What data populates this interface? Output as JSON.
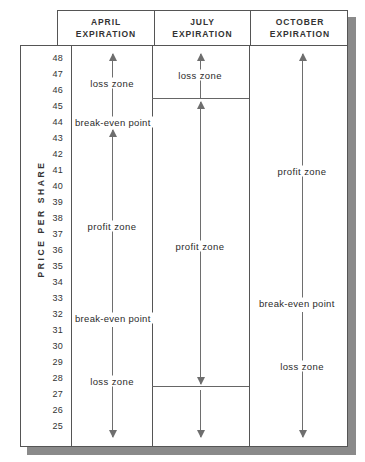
{
  "figure": {
    "kind": "option-expiration-profit-loss-diagram",
    "axis_title": "PRICE PER SHARE"
  },
  "chart_data": {
    "type": "table",
    "title": "",
    "xlabel": "",
    "ylabel": "PRICE PER SHARE",
    "ylim": [
      25,
      48
    ],
    "grid": false,
    "legend": "none",
    "categories": [
      "APRIL EXPIRATION",
      "JULY EXPIRATION",
      "OCTOBER EXPIRATION"
    ],
    "y_ticks": [
      48,
      47,
      46,
      45,
      44,
      43,
      42,
      41,
      40,
      39,
      38,
      37,
      36,
      35,
      34,
      33,
      32,
      31,
      30,
      29,
      28,
      27,
      26,
      25
    ],
    "series": [
      {
        "name": "APRIL EXPIRATION",
        "break_even_points": [
          44,
          32
        ],
        "zones": [
          {
            "label": "loss zone",
            "from": 44,
            "to": 48,
            "direction": "up"
          },
          {
            "label": "profit zone",
            "from": 44,
            "to": 32,
            "direction": "down"
          },
          {
            "label": "loss zone",
            "from": 32,
            "to": 25,
            "direction": "down"
          }
        ]
      },
      {
        "name": "JULY EXPIRATION",
        "break_even_points": [
          45.7,
          27.8
        ],
        "zones": [
          {
            "label": "loss zone",
            "from": 45.7,
            "to": 48,
            "direction": "up"
          },
          {
            "label": "profit zone",
            "from": 45.7,
            "to": 27.8,
            "direction": "down"
          },
          {
            "label": "loss zone",
            "from": 27.8,
            "to": 25,
            "direction": "down"
          }
        ]
      },
      {
        "name": "OCTOBER EXPIRATION",
        "break_even_points": [
          33.5
        ],
        "zones": [
          {
            "label": "profit zone",
            "from": 33.5,
            "to": 48,
            "direction": "up"
          },
          {
            "label": "loss zone",
            "from": 33.5,
            "to": 25,
            "direction": "down"
          }
        ]
      }
    ]
  },
  "header": {
    "columns": [
      {
        "line1": "APRIL",
        "line2": "EXPIRATION"
      },
      {
        "line1": "JULY",
        "line2": "EXPIRATION"
      },
      {
        "line1": "OCTOBER",
        "line2": "EXPIRATION"
      }
    ]
  },
  "axis": {
    "title": "PRICE PER SHARE",
    "ticks": [
      "48",
      "47",
      "46",
      "45",
      "44",
      "43",
      "42",
      "41",
      "40",
      "39",
      "38",
      "37",
      "36",
      "35",
      "34",
      "33",
      "32",
      "31",
      "30",
      "29",
      "28",
      "27",
      "26",
      "25"
    ]
  },
  "april": {
    "loss_top": "loss zone",
    "break_even_top": "break-even point",
    "profit": "profit zone",
    "break_even_bottom": "break-even point",
    "loss_bottom": "loss zone"
  },
  "july": {
    "loss_top": "loss zone",
    "profit": "profit zone",
    "loss_bottom": "loss zone"
  },
  "october": {
    "profit": "profit zone",
    "break_even": "break-even point",
    "loss": "loss zone"
  },
  "colors": {
    "line": "#555555",
    "arrow": "#6e6e6e",
    "text": "#2b2b2b",
    "shadow": "#8a8a8a",
    "background": "#ffffff"
  }
}
